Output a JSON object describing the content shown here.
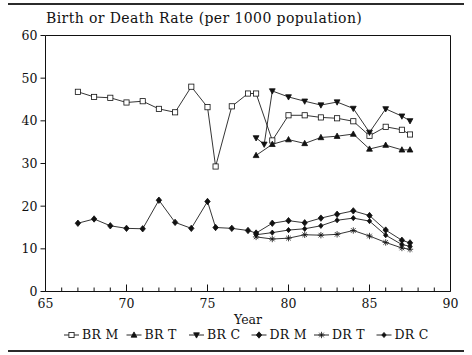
{
  "figure": {
    "title": "Birth or Death Rate (per 1000 population)",
    "rules": {
      "top": true,
      "bottom": true
    }
  },
  "chart_data": {
    "type": "line",
    "title": "Birth or Death Rate (per 1000 population)",
    "xlabel": "Year",
    "ylabel": "",
    "xlim": [
      65,
      90
    ],
    "ylim": [
      0,
      60
    ],
    "xticks": [
      65,
      70,
      75,
      80,
      85,
      90
    ],
    "xtick_labels": [
      "65",
      "70",
      "75",
      "80",
      "85",
      "90"
    ],
    "yticks": [
      0,
      10,
      20,
      30,
      40,
      50,
      60
    ],
    "ytick_labels": [
      "0",
      "10",
      "20",
      "30",
      "40",
      "50",
      "60"
    ],
    "minor_xtick_step": 1,
    "grid": false,
    "legend_position": "below-axis",
    "series": [
      {
        "name": "BR M",
        "marker": "square",
        "x": [
          67,
          68,
          69,
          70,
          71,
          72,
          73,
          74,
          75,
          75.5,
          76.5,
          77.5,
          78,
          79,
          80,
          81,
          82,
          83,
          84,
          85,
          86,
          87,
          87.5
        ],
        "y": [
          46.8,
          45.6,
          45.4,
          44.3,
          44.6,
          42.8,
          42.0,
          48.0,
          43.2,
          29.3,
          43.4,
          46.4,
          46.4,
          35.4,
          41.3,
          41.3,
          40.8,
          40.6,
          39.9,
          36.5,
          38.6,
          37.9,
          36.8
        ]
      },
      {
        "name": "BR T",
        "marker": "triangle-up",
        "x": [
          78,
          79,
          80,
          81,
          82,
          83,
          84,
          85,
          86,
          87,
          87.5
        ],
        "y": [
          31.9,
          34.5,
          35.6,
          34.7,
          36.1,
          36.4,
          36.9,
          33.4,
          34.3,
          33.2,
          33.2
        ]
      },
      {
        "name": "BR C",
        "marker": "triangle-down",
        "x": [
          78,
          78.5,
          79,
          80,
          81,
          82,
          83,
          84,
          85,
          86,
          87,
          87.5
        ],
        "y": [
          36.0,
          34.5,
          47.0,
          45.6,
          44.6,
          43.7,
          44.4,
          42.9,
          37.3,
          42.8,
          41.1,
          40.0
        ]
      },
      {
        "name": "DR M",
        "marker": "diamond",
        "x": [
          67,
          68,
          69,
          70,
          71,
          72,
          73,
          74,
          75,
          75.5,
          76.5,
          77.5,
          78,
          79,
          80,
          81,
          82,
          83,
          84,
          85,
          86,
          87,
          87.5
        ],
        "y": [
          16.0,
          17.0,
          15.4,
          14.8,
          14.7,
          21.4,
          16.2,
          14.8,
          21.1,
          15.0,
          14.8,
          14.3,
          13.7,
          16.0,
          16.6,
          16.1,
          17.2,
          18.1,
          18.9,
          17.8,
          14.4,
          12.0,
          11.4
        ]
      },
      {
        "name": "DR T",
        "marker": "star",
        "x": [
          78,
          79,
          80,
          81,
          82,
          83,
          84,
          85,
          86,
          87,
          87.5
        ],
        "y": [
          12.8,
          12.3,
          12.5,
          13.3,
          13.2,
          13.4,
          14.3,
          13.0,
          11.5,
          10.2,
          9.9
        ]
      },
      {
        "name": "DR C",
        "marker": "diamond-small",
        "x": [
          78,
          79,
          80,
          81,
          82,
          83,
          84,
          85,
          86,
          87,
          87.5
        ],
        "y": [
          13.3,
          13.8,
          14.4,
          14.7,
          15.4,
          16.7,
          17.2,
          16.5,
          13.2,
          11.0,
          10.6
        ]
      }
    ],
    "legend": [
      {
        "label": "BR M",
        "marker": "square"
      },
      {
        "label": "BR T",
        "marker": "triangle-up"
      },
      {
        "label": "BR C",
        "marker": "triangle-down"
      },
      {
        "label": "DR M",
        "marker": "diamond"
      },
      {
        "label": "DR T",
        "marker": "star"
      },
      {
        "label": "DR C",
        "marker": "diamond-small"
      }
    ]
  }
}
